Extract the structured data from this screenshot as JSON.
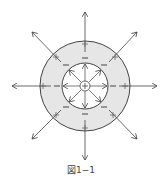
{
  "figure": {
    "caption": "図1−1",
    "outer_shell_fill": "#e6e6e6",
    "line_color": "#444444",
    "center_charge": "+",
    "inner_surface_charge": "−",
    "outer_surface_charge": "+",
    "inner_signs_count": 8,
    "outer_signs_count": 8,
    "outward_arrows": 8,
    "inward_arrows": 8
  }
}
